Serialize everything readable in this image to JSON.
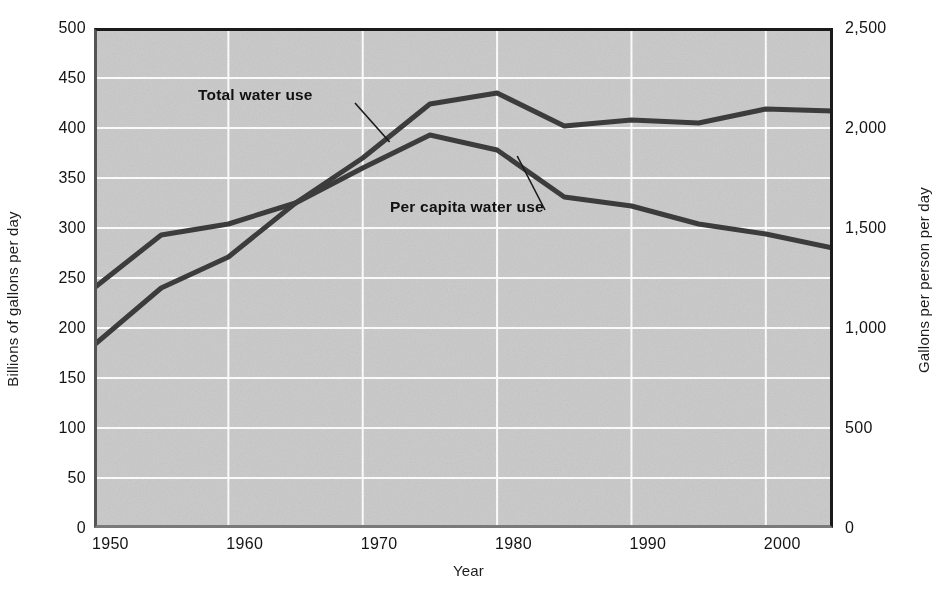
{
  "chart_data": {
    "type": "line",
    "title": "",
    "subtitle": "",
    "xlabel": "Year",
    "ylabel": "Billions of gallons per day",
    "ylabel_right": "Gallons per person per day",
    "grid": true,
    "legend_position": "inline-annotations",
    "xlim": [
      1950,
      2005
    ],
    "ylim": [
      0,
      500
    ],
    "ylim_right": [
      0,
      2500
    ],
    "xticks": [
      1950,
      1960,
      1970,
      1980,
      1990,
      2000
    ],
    "xticklabels": [
      "1950",
      "1960",
      "1970",
      "1980",
      "1990",
      "2000"
    ],
    "yticks": [
      0,
      50,
      100,
      150,
      200,
      250,
      300,
      350,
      400,
      450,
      500
    ],
    "yticklabels": [
      "0",
      "50",
      "100",
      "150",
      "200",
      "250",
      "300",
      "350",
      "400",
      "450",
      "500"
    ],
    "yticks_right": [
      0,
      500,
      1000,
      1500,
      2000,
      2500
    ],
    "yticklabels_right": [
      "0",
      "500",
      "1,000",
      "1,500",
      "2,000",
      "2,500"
    ],
    "x": [
      1950,
      1955,
      1960,
      1965,
      1970,
      1975,
      1980,
      1985,
      1990,
      1995,
      2000,
      2005
    ],
    "series": [
      {
        "name": "Total water use",
        "axis": "left",
        "units": "Billions of gallons per day",
        "color": "#3d3d3d",
        "values": [
          240,
          293,
          304,
          325,
          370,
          424,
          435,
          402,
          408,
          405,
          419,
          417
        ]
      },
      {
        "name": "Per capita water use",
        "axis": "right",
        "units": "Gallons per person per day",
        "values_right": [
          915,
          1200,
          1355,
          1625,
          1800,
          1965,
          1890,
          1655,
          1610,
          1520,
          1470,
          1400
        ],
        "color": "#3d3d3d",
        "values": [
          183,
          240,
          271,
          325,
          360,
          393,
          378,
          331,
          322,
          304,
          294,
          280
        ]
      }
    ],
    "annotations": [
      {
        "text": "Total water use",
        "target_x": 1972,
        "target_y": 386
      },
      {
        "text": "Per capita water use",
        "target_x": 1981.5,
        "target_y": 372
      }
    ]
  },
  "colors": {
    "plot_background": "#cccccc",
    "gridline": "#ffffff",
    "line": "#3d3d3d",
    "axis": "#1a1a1a",
    "text": "#141414",
    "page_background": "#ffffff"
  }
}
